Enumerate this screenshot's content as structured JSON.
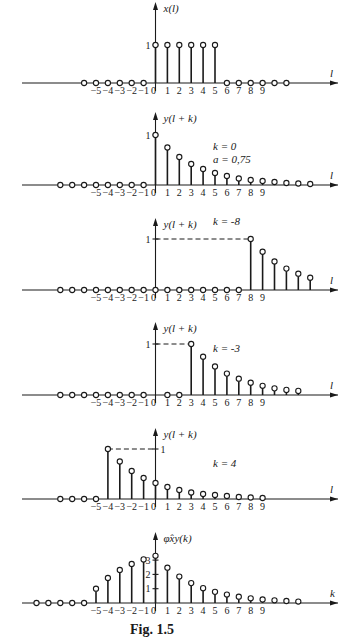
{
  "caption": "Fig. 1.5",
  "chart_data": [
    {
      "type": "stem",
      "title": "x(l)",
      "ylabel": "x(l)",
      "xlabel": "l",
      "x_tick_labels": [
        "-5",
        "-4",
        "-3",
        "-2",
        "-1",
        "0",
        "1",
        "2",
        "3",
        "4",
        "5",
        "6",
        "7",
        "8",
        "9"
      ],
      "y_tick_labels": [
        "1"
      ],
      "x": [
        -6,
        -5,
        -4,
        -3,
        -2,
        -1,
        0,
        1,
        2,
        3,
        4,
        5,
        6,
        7,
        8,
        9,
        10,
        11
      ],
      "values": [
        0,
        0,
        0,
        0,
        0,
        0,
        1,
        1,
        1,
        1,
        1,
        1,
        0,
        0,
        0,
        0,
        0,
        0
      ]
    },
    {
      "type": "stem",
      "title": "y(l + k)",
      "ylabel": "y(l + k)",
      "xlabel": "l",
      "annotations": [
        "k = 0",
        "a = 0,75"
      ],
      "k": 0,
      "a": 0.75,
      "x_tick_labels": [
        "-5",
        "-4",
        "-3",
        "-2",
        "-1",
        "0",
        "1",
        "2",
        "3",
        "4",
        "5",
        "6",
        "7",
        "8",
        "9"
      ],
      "y_tick_labels": [
        "1"
      ],
      "x": [
        -8,
        -7,
        -6,
        -5,
        -4,
        -3,
        -2,
        -1,
        0,
        1,
        2,
        3,
        4,
        5,
        6,
        7,
        8,
        9,
        10,
        11,
        12,
        13
      ],
      "values": [
        0,
        0,
        0,
        0,
        0,
        0,
        0,
        0,
        1,
        0.75,
        0.56,
        0.42,
        0.32,
        0.24,
        0.18,
        0.13,
        0.1,
        0.08,
        0.06,
        0.04,
        0.03,
        0.02
      ]
    },
    {
      "type": "stem",
      "title": "y(l + k)",
      "ylabel": "y(l + k)",
      "xlabel": "l",
      "annotations": [
        "k = -8"
      ],
      "k": -8,
      "x_tick_labels": [
        "-5",
        "-4",
        "-3",
        "-2",
        "-1",
        "0",
        "1",
        "2",
        "3",
        "4",
        "5",
        "6",
        "7",
        "8",
        "9"
      ],
      "y_tick_labels": [
        "1"
      ],
      "x": [
        -8,
        -7,
        -6,
        -5,
        -4,
        -3,
        -2,
        -1,
        0,
        1,
        2,
        3,
        4,
        5,
        6,
        7,
        8,
        9,
        10,
        11,
        12,
        13
      ],
      "values": [
        0,
        0,
        0,
        0,
        0,
        0,
        0,
        0,
        0,
        0,
        0,
        0,
        0,
        0,
        0,
        0,
        1,
        0.75,
        0.56,
        0.42,
        0.32,
        0.24
      ]
    },
    {
      "type": "stem",
      "title": "y(l + k)",
      "ylabel": "y(l + k)",
      "xlabel": "l",
      "annotations": [
        "k = -3"
      ],
      "k": -3,
      "x_tick_labels": [
        "-5",
        "-4",
        "-3",
        "-2",
        "-1",
        "0",
        "1",
        "2",
        "3",
        "4",
        "5",
        "6",
        "7",
        "8",
        "9"
      ],
      "y_tick_labels": [
        "1"
      ],
      "x": [
        -8,
        -7,
        -6,
        -5,
        -4,
        -3,
        -2,
        -1,
        1,
        2,
        3,
        4,
        5,
        6,
        7,
        8,
        9,
        10,
        11,
        12
      ],
      "values": [
        0,
        0,
        0,
        0,
        0,
        0,
        0,
        0,
        0,
        0,
        1,
        0.75,
        0.56,
        0.42,
        0.32,
        0.24,
        0.18,
        0.13,
        0.1,
        0.08
      ]
    },
    {
      "type": "stem",
      "title": "y(l + k)",
      "ylabel": "y(l + k)",
      "xlabel": "l",
      "annotations": [
        "k = 4"
      ],
      "k": 4,
      "x_tick_labels": [
        "-5",
        "-4",
        "-3",
        "-2",
        "-1",
        "0",
        "1",
        "2",
        "3",
        "4",
        "5",
        "6",
        "7",
        "8",
        "9"
      ],
      "y_tick_labels": [
        "1"
      ],
      "x": [
        -8,
        -7,
        -6,
        -5,
        -4,
        -3,
        -2,
        -1,
        0,
        1,
        2,
        3,
        4,
        5,
        6,
        7,
        8,
        9
      ],
      "values": [
        0,
        0,
        0,
        0,
        1,
        0.75,
        0.56,
        0.42,
        0.32,
        0.24,
        0.18,
        0.13,
        0.1,
        0.08,
        0.06,
        0.04,
        0.03,
        0.02
      ]
    },
    {
      "type": "stem",
      "title": "φ̂xy(k)",
      "ylabel": "φ̂xy(k)",
      "xlabel": "k",
      "x_tick_labels": [
        "-5",
        "-4",
        "-3",
        "-2",
        "-1",
        "0",
        "1",
        "2",
        "3",
        "4",
        "5",
        "6",
        "7",
        "8",
        "9"
      ],
      "y_tick_labels": [
        "1",
        "2",
        "3"
      ],
      "ylim": [
        0,
        3.5
      ],
      "x": [
        -10,
        -9,
        -8,
        -7,
        -6,
        -5,
        -4,
        -3,
        -2,
        -1,
        0,
        1,
        2,
        3,
        4,
        5,
        6,
        7,
        8,
        9,
        10,
        11,
        12
      ],
      "values": [
        0,
        0,
        0,
        0,
        0,
        1,
        1.75,
        2.31,
        2.73,
        3.05,
        3.3,
        2.47,
        1.85,
        1.39,
        1.04,
        0.78,
        0.59,
        0.44,
        0.33,
        0.25,
        0.19,
        0.14,
        0.1
      ]
    }
  ]
}
